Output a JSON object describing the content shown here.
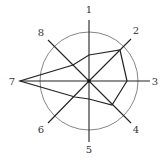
{
  "diagram": {
    "type": "radar-star",
    "center": [
      89,
      81
    ],
    "circle_radius": 49,
    "axes": [
      {
        "label": "1",
        "end": [
          89,
          20
        ],
        "label_pos": [
          89,
          13
        ]
      },
      {
        "label": "2",
        "end": [
          131,
          39
        ],
        "label_pos": [
          136,
          34
        ]
      },
      {
        "label": "3",
        "end": [
          150,
          81
        ],
        "label_pos": [
          155,
          85
        ]
      },
      {
        "label": "4",
        "end": [
          131,
          123
        ],
        "label_pos": [
          136,
          133
        ]
      },
      {
        "label": "5",
        "end": [
          89,
          142
        ],
        "label_pos": [
          89,
          153
        ]
      },
      {
        "label": "6",
        "end": [
          48,
          123
        ],
        "label_pos": [
          41,
          133
        ]
      },
      {
        "label": "7",
        "end": [
          20,
          81
        ],
        "label_pos": [
          12,
          85
        ]
      },
      {
        "label": "8",
        "end": [
          48,
          40
        ],
        "label_pos": [
          41,
          36
        ]
      }
    ],
    "polygon": [
      [
        89,
        55
      ],
      [
        120,
        50
      ],
      [
        127,
        81
      ],
      [
        112,
        105
      ],
      [
        89,
        99
      ],
      [
        75,
        97
      ],
      [
        20,
        81
      ],
      [
        73,
        65
      ]
    ]
  }
}
